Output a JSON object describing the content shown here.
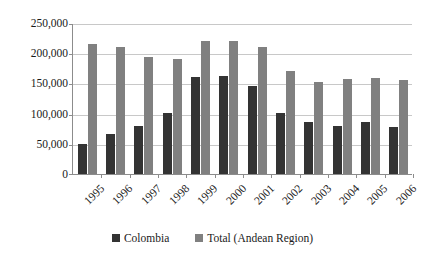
{
  "chart_data": {
    "type": "bar",
    "title": "",
    "subtitle": "",
    "xlabel": "",
    "ylabel": "",
    "categories": [
      "1995",
      "1996",
      "1997",
      "1998",
      "1999",
      "2000",
      "2001",
      "2002",
      "2003",
      "2004",
      "2005",
      "2006"
    ],
    "series": [
      {
        "name": "Colombia",
        "color": "#333333",
        "values": [
          50000,
          67000,
          80000,
          101000,
          160000,
          163000,
          145000,
          101000,
          86000,
          80000,
          86000,
          78000
        ]
      },
      {
        "name": "Total (Andean Region)",
        "color": "#808080",
        "values": [
          215000,
          210000,
          193000,
          190000,
          220000,
          221000,
          210000,
          170000,
          152000,
          157000,
          159000,
          155000
        ]
      }
    ],
    "ylim": [
      0,
      250000
    ],
    "ytick_values": [
      0,
      50000,
      100000,
      150000,
      200000,
      250000
    ],
    "ytick_labels": [
      "0",
      "50,000",
      "100,000",
      "150,000",
      "200,000",
      "250,000"
    ],
    "grid": true,
    "grid_axis": "y",
    "legend_position": "bottom",
    "xtick_rotation": -45
  },
  "legend": {
    "items": [
      {
        "label": "Colombia",
        "color": "#333333"
      },
      {
        "label": "Total (Andean Region)",
        "color": "#808080"
      }
    ]
  }
}
